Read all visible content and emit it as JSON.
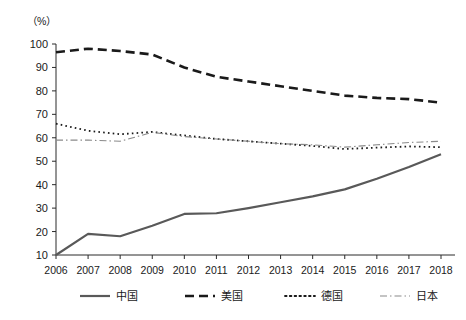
{
  "chart_data": {
    "type": "line",
    "title": "",
    "subtitle": "",
    "xlabel": "",
    "ylabel": "",
    "unit_label": "（%）",
    "x": [
      2006,
      2007,
      2008,
      2009,
      2010,
      2011,
      2012,
      2013,
      2014,
      2015,
      2016,
      2017,
      2018
    ],
    "categories": [
      "2006",
      "2007",
      "2008",
      "2009",
      "2010",
      "2011",
      "2012",
      "2013",
      "2014",
      "2015",
      "2016",
      "2017",
      "2018"
    ],
    "xlim": [
      2006,
      2018
    ],
    "ylim": [
      10,
      100
    ],
    "yticks": [
      10,
      20,
      30,
      40,
      50,
      60,
      70,
      80,
      90,
      100
    ],
    "ytick_labels": [
      "10",
      "20",
      "30",
      "40",
      "50",
      "60",
      "70",
      "80",
      "90",
      "100"
    ],
    "grid": false,
    "legend_position": "bottom",
    "series": [
      {
        "name": "中国",
        "style": "solid",
        "color": "#595959",
        "width": 2.2,
        "values": [
          10.0,
          19.0,
          18.0,
          22.5,
          27.5,
          27.8,
          30.0,
          32.5,
          35.0,
          38.0,
          42.5,
          47.5,
          53.0
        ]
      },
      {
        "name": "美国",
        "style": "dashed",
        "color": "#1a1a1a",
        "width": 2.6,
        "values": [
          96.5,
          98.0,
          97.0,
          95.5,
          90.0,
          86.0,
          84.0,
          82.0,
          80.0,
          78.0,
          77.0,
          76.5,
          75.0
        ]
      },
      {
        "name": "德国",
        "style": "dotted",
        "color": "#1a1a1a",
        "width": 1.8,
        "values": [
          66.0,
          63.0,
          61.5,
          62.5,
          61.0,
          59.5,
          58.5,
          57.5,
          56.5,
          55.2,
          55.8,
          56.3,
          56.0
        ]
      },
      {
        "name": "日本",
        "style": "dashdot",
        "color": "#8a8a8a",
        "width": 1.1,
        "values": [
          59.0,
          59.0,
          58.5,
          62.3,
          60.5,
          59.5,
          58.5,
          57.5,
          57.0,
          56.0,
          57.0,
          58.0,
          58.5
        ]
      }
    ]
  },
  "legend": {
    "items": [
      {
        "label": "中国",
        "style": "solid"
      },
      {
        "label": "美国",
        "style": "dashed"
      },
      {
        "label": "德国",
        "style": "dotted"
      },
      {
        "label": "日本",
        "style": "dashdot"
      }
    ]
  }
}
